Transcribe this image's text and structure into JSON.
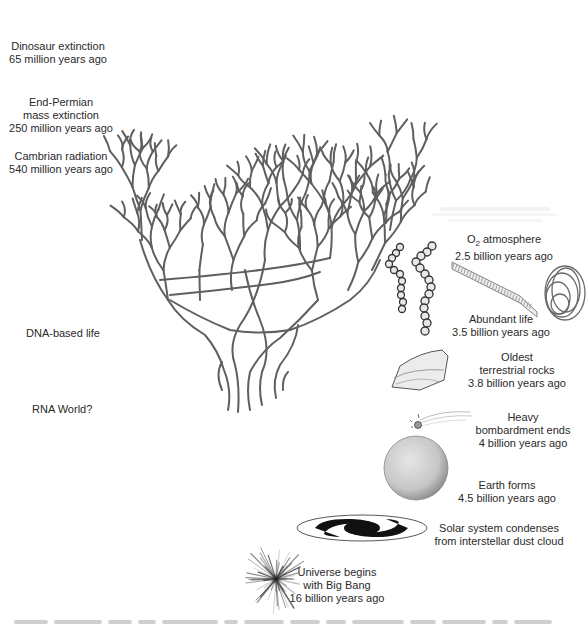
{
  "left_labels": [
    {
      "id": "dinosaur",
      "lines": [
        "Dinosaur extinction",
        "65 million years ago"
      ]
    },
    {
      "id": "permian",
      "lines": [
        "End-Permian",
        "mass extinction",
        "250 million years ago"
      ]
    },
    {
      "id": "cambrian",
      "lines": [
        "Cambrian radiation",
        "540 million years ago"
      ]
    },
    {
      "id": "dna",
      "lines": [
        "DNA-based life"
      ]
    },
    {
      "id": "rna",
      "lines": [
        "RNA World?"
      ]
    }
  ],
  "right_labels": {
    "o2": {
      "prefix": "O",
      "sub": "2",
      "suffix": " atmosphere",
      "line2": "2.5 billion years ago"
    },
    "abundant": {
      "lines": [
        "Abundant life",
        "3.5 billion years ago"
      ]
    },
    "rocks": {
      "lines": [
        "Oldest",
        "terrestrial rocks",
        "3.8 billion years ago"
      ]
    },
    "bombardment": {
      "lines": [
        "Heavy",
        "bombardment ends",
        "4 billion years ago"
      ]
    },
    "earth": {
      "lines": [
        "Earth forms",
        "4.5 billion years ago"
      ]
    },
    "solar": {
      "lines": [
        "Solar system condenses",
        "from interstellar dust cloud"
      ]
    },
    "bigbang": {
      "lines": [
        "Universe begins",
        "with Big Bang",
        "16 billion years ago"
      ]
    }
  },
  "illustrations": [
    "tree-of-life",
    "bacteria-chains",
    "stromatolite-strip",
    "coiled-filament",
    "rock",
    "comet",
    "earth-sphere",
    "spiral-galaxy",
    "big-bang-burst"
  ],
  "colors": {
    "branch": "#5a5a5a",
    "text": "#2a2a2a"
  }
}
